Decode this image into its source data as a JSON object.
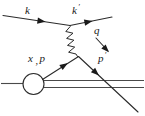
{
  "figure": {
    "type": "feynman-diagram",
    "background_color": "#ffffff",
    "line_color": "#2b2b2b",
    "hadron_line_color": "#4a4a4a",
    "width": 145,
    "height": 116
  },
  "labels": {
    "incoming_lepton": "k",
    "outgoing_lepton_base": "k",
    "outgoing_lepton_prime": "′",
    "photon": "q",
    "struck_parton_x": "x",
    "struck_parton_comma": ",",
    "struck_parton_p": "p",
    "outgoing_parton_base": "p",
    "outgoing_parton_prime": "′"
  },
  "elements": {
    "incoming_lepton_line": "incoming-lepton-line",
    "outgoing_lepton_line": "outgoing-lepton-line",
    "photon_wavy_line": "photon-propagator",
    "photon_momentum_arrow": "photon-momentum-arrow",
    "struck_parton_line": "struck-parton-line",
    "outgoing_parton_line": "outgoing-parton-line",
    "proton_blob": "proton-blob",
    "proton_incoming_line": "proton-incoming-line",
    "spectator_line_upper": "spectator-line-upper",
    "spectator_line_lower": "spectator-line-lower"
  }
}
